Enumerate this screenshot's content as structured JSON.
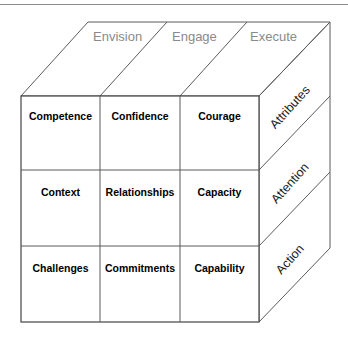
{
  "diagram": {
    "type": "3d-cube-matrix",
    "top_axis_name": "Process",
    "side_axis_name": "Domain",
    "colors": {
      "background": "#ffffff",
      "edge_stroke": "#5b5b5b",
      "front_stroke": "#444444",
      "top_label_color": "#8a8a8a",
      "side_label_color": "#1a1a1a",
      "cell_label_color": "#000000",
      "page_rule": "#8e8e8e"
    }
  },
  "top_labels": [
    {
      "text": "Envision",
      "x": 93,
      "y": 41
    },
    {
      "text": "Engage",
      "x": 172,
      "y": 41
    },
    {
      "text": "Execute",
      "x": 250,
      "y": 41
    }
  ],
  "side_labels": [
    {
      "text": "Attributes",
      "cx": 293,
      "cy": 106,
      "angle": -48
    },
    {
      "text": "Attention",
      "cx": 293,
      "cy": 182,
      "angle": -48
    },
    {
      "text": "Action",
      "cx": 293,
      "cy": 258,
      "angle": -48
    }
  ],
  "front_grid": {
    "columns": [
      "Envision",
      "Engage",
      "Execute"
    ],
    "rows": [
      "Attributes",
      "Attention",
      "Action"
    ],
    "cells": [
      [
        {
          "label": "Competence",
          "cx": 60.5,
          "cy": 119
        },
        {
          "label": "Confidence",
          "cx": 140,
          "cy": 119
        },
        {
          "label": "Courage",
          "cx": 219.5,
          "cy": 119
        }
      ],
      [
        {
          "label": "Context",
          "cx": 60.5,
          "cy": 195
        },
        {
          "label": "Relationships",
          "cx": 140,
          "cy": 195
        },
        {
          "label": "Capacity",
          "cx": 219.5,
          "cy": 195
        }
      ],
      [
        {
          "label": "Challenges",
          "cx": 60.5,
          "cy": 271
        },
        {
          "label": "Commitments",
          "cx": 140,
          "cy": 271
        },
        {
          "label": "Capability",
          "cx": 219.5,
          "cy": 271
        }
      ]
    ]
  },
  "geometry": {
    "front": {
      "left": 21,
      "top": 96,
      "right": 259,
      "bottom": 322
    },
    "depth": {
      "dx": 67,
      "dy": -74
    },
    "col_dividers": [
      100,
      180
    ],
    "row_dividers": [
      170,
      246
    ],
    "page_rule_y": 4
  }
}
